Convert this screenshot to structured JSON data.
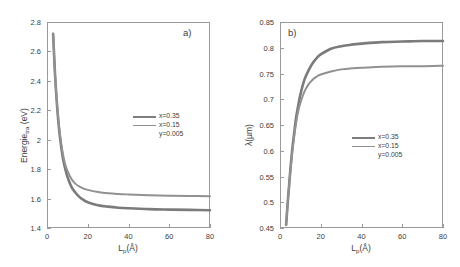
{
  "figure": {
    "panels": [
      {
        "tag": "a)",
        "xlabel_main": "L",
        "xlabel_sub": "p",
        "xlabel_unit": "(Å)",
        "ylabel_main": "Energie",
        "ylabel_sub": "tra",
        "ylabel_unit": " (eV)",
        "xticks": [
          "0",
          "20",
          "40",
          "60",
          "80"
        ],
        "yticks": [
          "1.4",
          "1.6",
          "1.8",
          "2",
          "2.2",
          "2.4",
          "2.6",
          "2.8"
        ],
        "legend": [
          {
            "label": "x=0.35",
            "swatch": true,
            "thin": false
          },
          {
            "label": "x=0.15",
            "swatch": true,
            "thin": true
          },
          {
            "label": "y=0.005",
            "swatch": false,
            "thin": false
          }
        ]
      },
      {
        "tag": "b)",
        "xlabel_main": "L",
        "xlabel_sub": "p",
        "xlabel_unit": "(Å)",
        "ylabel_main": "λ(µm)",
        "ylabel_sub": "",
        "ylabel_unit": "",
        "xticks": [
          "0",
          "20",
          "40",
          "60",
          "80"
        ],
        "yticks": [
          "0.45",
          "0.5",
          "0.55",
          "0.6",
          "0.65",
          "0.7",
          "0.75",
          "0.8",
          "0.85"
        ],
        "legend": [
          {
            "label": "x=0.35",
            "swatch": true,
            "thin": false
          },
          {
            "label": "x=0.15",
            "swatch": true,
            "thin": true
          },
          {
            "label": "y=0.005",
            "swatch": false,
            "thin": false
          }
        ]
      }
    ]
  },
  "chart_data": [
    {
      "type": "line",
      "title": "a)",
      "xlabel": "Lp(Å)",
      "ylabel": "Energie_tra (eV)",
      "xlim": [
        0,
        80
      ],
      "ylim": [
        1.4,
        2.8
      ],
      "xticks": [
        0,
        20,
        40,
        60,
        80
      ],
      "yticks": [
        1.4,
        1.6,
        1.8,
        2.0,
        2.2,
        2.4,
        2.6,
        2.8
      ],
      "grid": false,
      "legend_position": "center-right",
      "x": [
        3,
        4,
        5,
        6,
        7,
        8,
        9,
        10,
        12,
        14,
        16,
        18,
        20,
        25,
        30,
        35,
        40,
        50,
        60,
        70,
        80
      ],
      "series": [
        {
          "name": "x=0.35",
          "values": [
            2.72,
            2.43,
            2.22,
            2.06,
            1.95,
            1.86,
            1.8,
            1.75,
            1.68,
            1.64,
            1.61,
            1.59,
            1.575,
            1.555,
            1.545,
            1.538,
            1.534,
            1.528,
            1.525,
            1.523,
            1.521
          ]
        },
        {
          "name": "x=0.15",
          "values": [
            2.72,
            2.43,
            2.23,
            2.08,
            1.97,
            1.89,
            1.83,
            1.79,
            1.733,
            1.7,
            1.681,
            1.668,
            1.659,
            1.645,
            1.636,
            1.631,
            1.628,
            1.623,
            1.62,
            1.618,
            1.616
          ]
        }
      ]
    },
    {
      "type": "line",
      "title": "b)",
      "xlabel": "Lp(Å)",
      "ylabel": "λ(µm)",
      "xlim": [
        0,
        80
      ],
      "ylim": [
        0.45,
        0.85
      ],
      "xticks": [
        0,
        20,
        40,
        60,
        80
      ],
      "yticks": [
        0.45,
        0.5,
        0.55,
        0.6,
        0.65,
        0.7,
        0.75,
        0.8,
        0.85
      ],
      "grid": false,
      "legend_position": "center-right",
      "x": [
        3,
        4,
        5,
        6,
        7,
        8,
        9,
        10,
        12,
        14,
        16,
        18,
        20,
        25,
        30,
        35,
        40,
        50,
        60,
        70,
        80
      ],
      "series": [
        {
          "name": "x=0.35",
          "values": [
            0.456,
            0.51,
            0.559,
            0.602,
            0.636,
            0.667,
            0.689,
            0.709,
            0.738,
            0.756,
            0.77,
            0.78,
            0.787,
            0.798,
            0.803,
            0.806,
            0.808,
            0.811,
            0.812,
            0.813,
            0.813
          ]
        },
        {
          "name": "x=0.15",
          "values": [
            0.456,
            0.51,
            0.556,
            0.596,
            0.629,
            0.656,
            0.678,
            0.693,
            0.715,
            0.729,
            0.738,
            0.744,
            0.748,
            0.754,
            0.758,
            0.76,
            0.761,
            0.763,
            0.764,
            0.764,
            0.765
          ]
        }
      ]
    }
  ]
}
